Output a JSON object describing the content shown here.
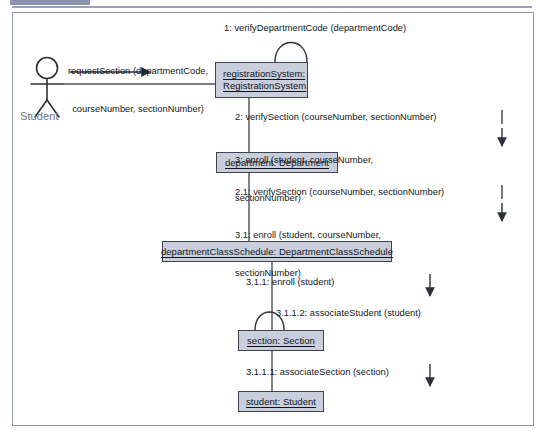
{
  "diagram": {
    "type": "uml-communication-diagram",
    "colors": {
      "object_fill": "#c9cedc",
      "object_border": "#3d4450",
      "frame_border": "#8d94ae",
      "header_bar": "#8e94b0",
      "actor_label": "#6b7283",
      "connector": "#4a4f58",
      "text": "#121820"
    },
    "actor": {
      "name": "actor-student",
      "label": "Student"
    },
    "objects": [
      {
        "name": "registration-system",
        "label_line1": "registrationSystem:",
        "label_line2": "RegistrationSystem"
      },
      {
        "name": "department",
        "label": "department: Department"
      },
      {
        "name": "department-class-schedule",
        "label": "departmentClassSchedule: DepartmentClassSchedule"
      },
      {
        "name": "section",
        "label": "section: Section"
      },
      {
        "name": "student",
        "label": "student: Student"
      }
    ],
    "messages": [
      {
        "name": "message-request-section",
        "line1": "requestSection (departmentCode,",
        "line2": "courseNumber, sectionNumber)"
      },
      {
        "name": "message-1",
        "text": "1: verifyDepartmentCode (departmentCode)"
      },
      {
        "name": "message-2",
        "text": "2: verifySection (courseNumber, sectionNumber)"
      },
      {
        "name": "message-3",
        "line1": "3: enroll (student, courseNumber,",
        "line2": "sectionNumber)"
      },
      {
        "name": "message-2-1",
        "text": "2.1: verifySection (courseNumber, sectionNumber)"
      },
      {
        "name": "message-3-1",
        "line1": "3.1: enroll (student, courseNumber,",
        "line2": "sectionNumber)"
      },
      {
        "name": "message-3-1-1",
        "text": "3.1.1: enroll (student)"
      },
      {
        "name": "message-3-1-1-2",
        "text": "3.1.1.2: associateStudent (student)"
      },
      {
        "name": "message-3-1-1-1",
        "text": "3.1.1.1: associateSection (section)"
      }
    ]
  }
}
